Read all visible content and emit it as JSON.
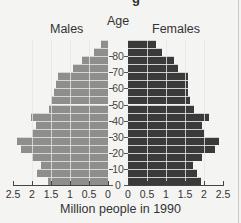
{
  "chart_data": {
    "type": "bar",
    "subtype": "population-pyramid",
    "title": "Age",
    "xlabel": "Million people in 1990",
    "ylabel": "Age",
    "legend": [
      "Males",
      "Females"
    ],
    "categories": [
      "0-4",
      "5-9",
      "10-14",
      "15-19",
      "20-24",
      "25-29",
      "30-34",
      "35-39",
      "40-44",
      "45-49",
      "50-54",
      "55-59",
      "60-64",
      "65-69",
      "70-74",
      "75-79",
      "80-84",
      "85-89"
    ],
    "series": [
      {
        "name": "Males",
        "color": "#8e8e8c",
        "values": [
          1.57,
          1.87,
          1.76,
          2.0,
          2.29,
          2.4,
          2.0,
          1.89,
          2.03,
          1.55,
          1.49,
          1.41,
          1.36,
          1.31,
          0.91,
          0.69,
          0.37,
          0.19
        ]
      },
      {
        "name": "Females",
        "color": "#3a3a3a",
        "values": [
          1.92,
          1.82,
          1.71,
          1.95,
          2.29,
          2.39,
          2.0,
          1.95,
          2.13,
          1.74,
          1.63,
          1.58,
          1.58,
          1.58,
          1.32,
          1.21,
          0.89,
          0.74
        ]
      }
    ],
    "xlim": [
      0,
      2.5
    ],
    "x_ticks": [
      "2.5",
      "2",
      "1.5",
      "1",
      "0.5",
      "0",
      "0",
      "0.5",
      "1",
      "1.5",
      "2",
      "2.5"
    ],
    "y_ticks": [
      "0",
      "10",
      "20",
      "30",
      "40",
      "50",
      "60",
      "70",
      "80"
    ],
    "grid": "vertical lines at 0.5 intervals inside bars",
    "legend_position": "top"
  },
  "labels": {
    "age": "Age",
    "males": "Males",
    "females": "Females",
    "xlabel": "Million people in 1990",
    "cut_title": "g"
  }
}
